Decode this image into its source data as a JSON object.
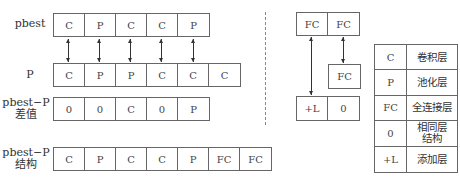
{
  "top_cut_text": "（a）小型结构（pbest和P）  （b）差值与结构      （c）添加层（全连接层）",
  "left": {
    "rows": [
      {
        "label": "pbest",
        "cells": [
          "C",
          "P",
          "C",
          "C",
          "P"
        ]
      },
      {
        "label": "P",
        "cells": [
          "C",
          "P",
          "P",
          "C",
          "C",
          "C"
        ]
      },
      {
        "label_line1": "pbest−P",
        "label_line2": "差值",
        "cells": [
          "0",
          "0",
          "C",
          "0",
          "P"
        ]
      },
      {
        "label_line1": "pbest−P",
        "label_line2": "结构",
        "cells": [
          "C",
          "P",
          "C",
          "C",
          "P",
          "FC",
          "FC"
        ]
      }
    ]
  },
  "right": {
    "top_row": [
      "FC",
      "FC"
    ],
    "middle_box": "FC",
    "bottom_row": [
      "+L",
      "0"
    ]
  },
  "legend": [
    {
      "key": "C",
      "value": "卷积层"
    },
    {
      "key": "P",
      "value": "池化层"
    },
    {
      "key": "FC",
      "value": "全连接层"
    },
    {
      "key": "0",
      "value_line1": "相同层",
      "value_line2": "结构"
    },
    {
      "key": "+L",
      "value": "添加层"
    }
  ]
}
